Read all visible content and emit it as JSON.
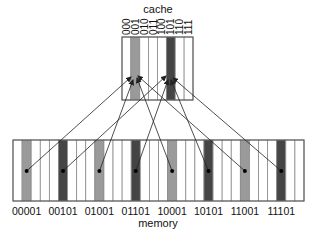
{
  "cache": {
    "title": "cache",
    "x": 122,
    "y": 37,
    "width": 71,
    "height": 63,
    "slots": [
      "000",
      "001",
      "010",
      "011",
      "100",
      "101",
      "110",
      "111"
    ],
    "highlight": {
      "1": "#9a9a9a",
      "5": "#454545"
    }
  },
  "memory": {
    "title": "memory",
    "x": 13,
    "y": 140,
    "width": 291,
    "height": 61,
    "columns": 32,
    "highlight": {
      "1": "#9a9a9a",
      "5": "#454545",
      "9": "#9a9a9a",
      "13": "#454545",
      "17": "#9a9a9a",
      "21": "#454545",
      "25": "#9a9a9a",
      "29": "#454545"
    },
    "labels": [
      {
        "col": 1,
        "text": "00001"
      },
      {
        "col": 5,
        "text": "00101"
      },
      {
        "col": 9,
        "text": "01001"
      },
      {
        "col": 13,
        "text": "01101"
      },
      {
        "col": 17,
        "text": "10001"
      },
      {
        "col": 21,
        "text": "10101"
      },
      {
        "col": 25,
        "text": "11001"
      },
      {
        "col": 29,
        "text": "11101"
      }
    ]
  },
  "mappings": [
    {
      "from_col": 1,
      "to": [
        131,
        77
      ]
    },
    {
      "from_col": 5,
      "to": [
        166,
        76
      ]
    },
    {
      "from_col": 9,
      "to": [
        133,
        80
      ]
    },
    {
      "from_col": 13,
      "to": [
        168,
        80
      ]
    },
    {
      "from_col": 17,
      "to": [
        137,
        78
      ]
    },
    {
      "from_col": 21,
      "to": [
        171,
        80
      ]
    },
    {
      "from_col": 25,
      "to": [
        138,
        76
      ]
    },
    {
      "from_col": 29,
      "to": [
        173,
        78
      ]
    }
  ],
  "style": {
    "grid_line": "#8a8a8a",
    "border": "#555555",
    "arrow": "#222222",
    "dot_y": 171
  }
}
